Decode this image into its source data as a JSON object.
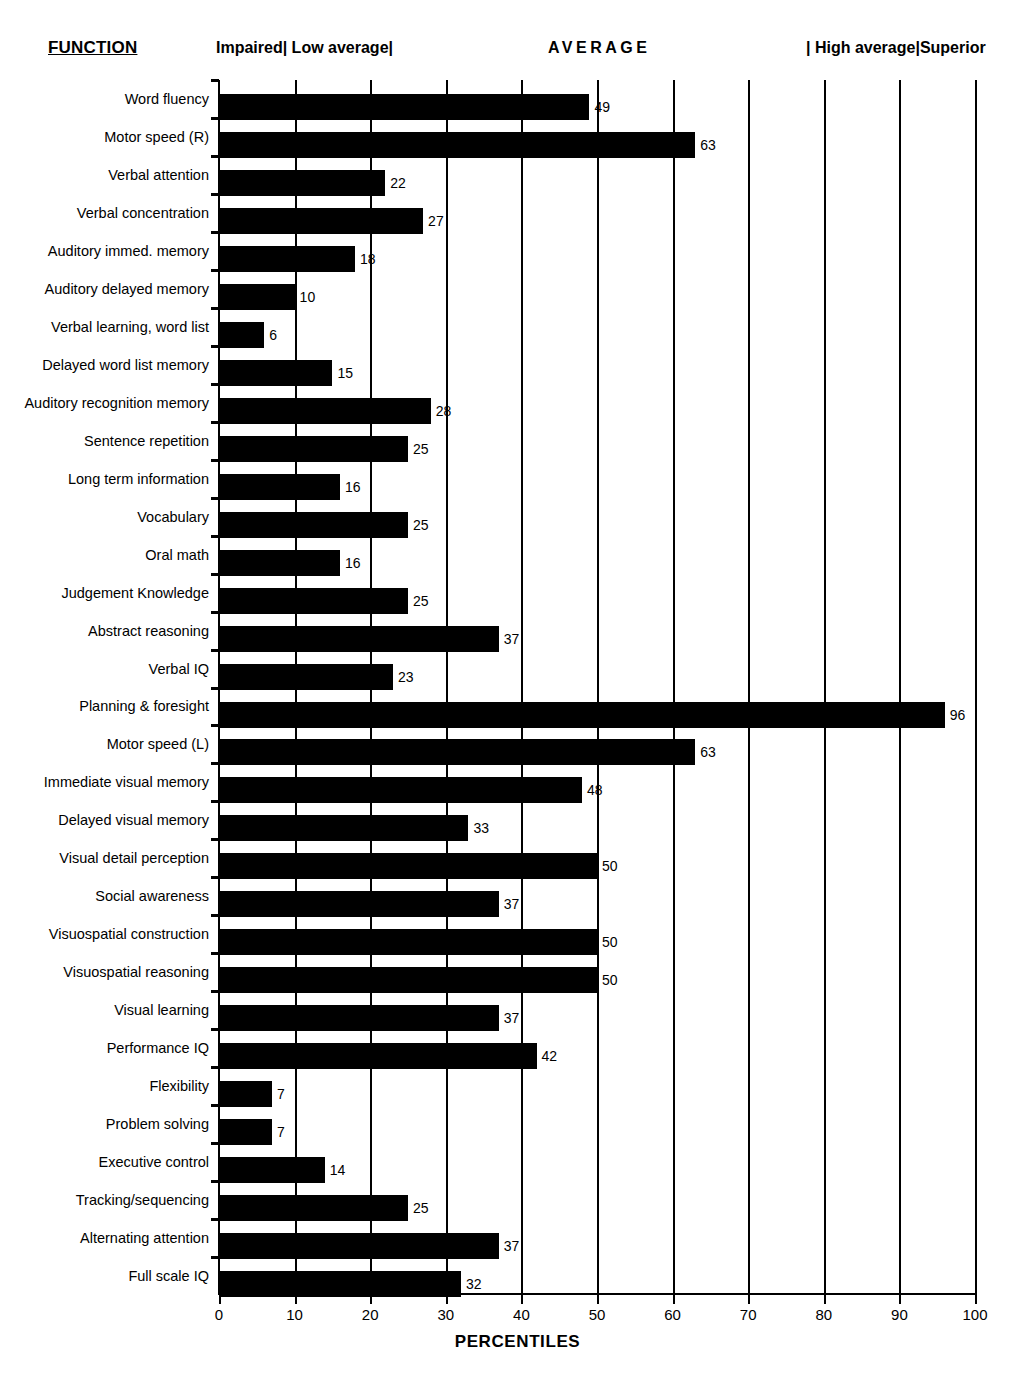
{
  "header": {
    "function_title": "FUNCTION",
    "bands": [
      {
        "name": "impaired-low-average",
        "label": "Impaired| Low average|"
      },
      {
        "name": "average",
        "label": "AVERAGE"
      },
      {
        "name": "high-average-superior",
        "label": "| High average|Superior"
      }
    ]
  },
  "chart_data": {
    "type": "bar",
    "orientation": "horizontal",
    "title": "",
    "xlabel": "PERCENTILES",
    "ylabel": "FUNCTION",
    "xlim": [
      0,
      100
    ],
    "xticks": [
      0,
      10,
      20,
      30,
      40,
      50,
      60,
      70,
      80,
      90,
      100
    ],
    "grid": true,
    "grid_axis": "x",
    "legend": "none",
    "bar_color": "#000000",
    "categories": [
      "Word fluency",
      "Motor speed (R)",
      "Verbal attention",
      "Verbal concentration",
      "Auditory immed. memory",
      "Auditory delayed memory",
      "Verbal learning, word list",
      "Delayed word list memory",
      "Auditory recognition memory",
      "Sentence repetition",
      "Long term information",
      "Vocabulary",
      "Oral math",
      "Judgement Knowledge",
      "Abstract reasoning",
      "Verbal IQ",
      "Planning & foresight",
      "Motor speed (L)",
      "Immediate visual memory",
      "Delayed visual memory",
      "Visual detail perception",
      "Social awareness",
      "Visuospatial construction",
      "Visuospatial reasoning",
      "Visual learning",
      "Performance IQ",
      "Flexibility",
      "Problem solving",
      "Executive control",
      "Tracking/sequencing",
      "Alternating attention",
      "Full scale IQ"
    ],
    "values": [
      49,
      63,
      22,
      27,
      18,
      10,
      6,
      15,
      28,
      25,
      16,
      25,
      16,
      25,
      37,
      23,
      96,
      63,
      48,
      33,
      50,
      37,
      50,
      50,
      37,
      42,
      7,
      7,
      14,
      25,
      37,
      32
    ]
  }
}
